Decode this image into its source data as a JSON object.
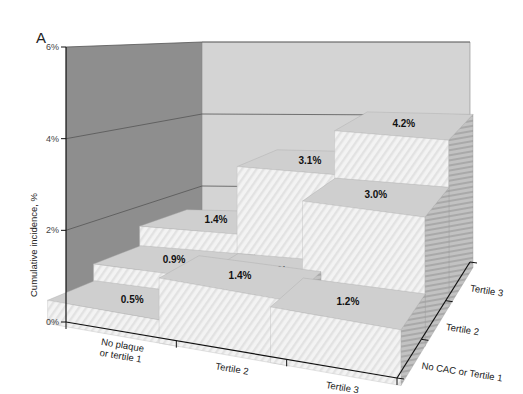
{
  "panel_label": "A",
  "chart_data": {
    "type": "bar",
    "subtype": "3d-bar",
    "title": "",
    "ylabel": "Cumulative incidence, %",
    "ylim": [
      0,
      6
    ],
    "yticks": [
      "0%",
      "2%",
      "4%",
      "6%"
    ],
    "x_axis": {
      "label": "",
      "categories": [
        "No plaque or tertile 1",
        "Tertile 2",
        "Tertile 3"
      ]
    },
    "depth_axis": {
      "label": "",
      "categories": [
        "No CAC or Tertile 1",
        "Tertile 2",
        "Tertile 3"
      ]
    },
    "series": [
      {
        "name": "No CAC or Tertile 1",
        "values": [
          0.5,
          1.4,
          1.2
        ]
      },
      {
        "name": "Tertile 2",
        "values": [
          0.9,
          0.9,
          3.0
        ]
      },
      {
        "name": "Tertile 3",
        "values": [
          1.4,
          3.1,
          4.2
        ]
      }
    ],
    "value_labels": [
      [
        "0.5%",
        "1.4%",
        "1.2%"
      ],
      [
        "0.9%",
        "0.9%",
        "3.0%"
      ],
      [
        "1.4%",
        "3.1%",
        "4.2%"
      ]
    ],
    "grid": true,
    "legend": "none"
  },
  "colors": {
    "left_wall": "#8e8e8e",
    "back_wall": "#d4d4d4",
    "floor": "#8a8a8a",
    "bar_front": "#f2f2f2",
    "bar_side": "#b9b9b9",
    "bar_top": "#cfcfcf",
    "grid": "#555555",
    "axis": "#111111"
  }
}
